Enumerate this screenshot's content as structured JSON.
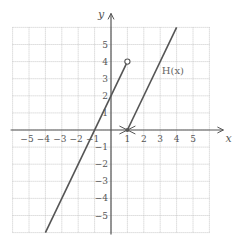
{
  "chart_data": {
    "type": "line",
    "title": "",
    "xlabel": "x",
    "ylabel": "y",
    "xlim": [
      -6,
      6
    ],
    "ylim": [
      -6,
      6
    ],
    "grid": true,
    "x_ticks": [
      -5,
      -4,
      -3,
      -2,
      -1,
      1,
      2,
      3,
      4,
      5
    ],
    "y_ticks": [
      -5,
      -4,
      -3,
      -2,
      -1,
      1,
      2,
      3,
      4,
      5
    ],
    "x_tick_labels": [
      "−5",
      "−4",
      "−3",
      "−2",
      "−1",
      "1",
      "2",
      "3",
      "4",
      "5"
    ],
    "y_tick_labels": [
      "−5",
      "−4",
      "−3",
      "−2",
      "−1",
      "1",
      "2",
      "3",
      "4",
      "5"
    ],
    "series": [
      {
        "name": "H(x) left piece",
        "formula": "2x + 2, x < 1",
        "points": [
          [
            -4,
            -6
          ],
          [
            1,
            4
          ]
        ],
        "end_marker": {
          "at": [
            1,
            4
          ],
          "type": "open-circle"
        }
      },
      {
        "name": "H(x) right piece",
        "formula": "2x - 2, x >= 1",
        "points": [
          [
            1,
            0
          ],
          [
            4,
            6
          ]
        ],
        "start_marker": {
          "at": [
            1,
            0
          ],
          "type": "closed-point"
        }
      }
    ],
    "annotations": [
      {
        "text": "H(x)",
        "at": [
          3.1,
          4
        ]
      }
    ]
  },
  "labels": {
    "x_axis": "x",
    "y_axis": "y",
    "function": "H(x)"
  },
  "colors": {
    "line": "#555555",
    "axis": "#555555",
    "grid": "#bbbbbb"
  }
}
